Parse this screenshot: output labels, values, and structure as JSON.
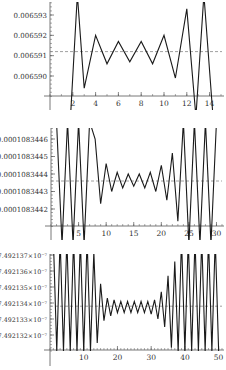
{
  "chart_data": [
    {
      "type": "line",
      "title": "",
      "xlabel": "",
      "ylabel": "",
      "x_ticks": [
        2,
        4,
        6,
        8,
        10,
        12,
        14
      ],
      "y_ticks": [
        0.00659,
        0.006591,
        0.006592,
        0.006593
      ],
      "y_tick_labels": [
        "0.006590",
        "0.006591",
        "0.006592",
        "0.006593"
      ],
      "xlim": [
        0,
        15
      ],
      "ylim": [
        0.0065886,
        0.0065937
      ],
      "reference_line": {
        "y": 0.0065912,
        "style": "dashed"
      },
      "series": [
        {
          "name": "iterates",
          "x": [
            1.8,
            2.4,
            3,
            4,
            5,
            6,
            7,
            8,
            9,
            10,
            11,
            12,
            12.8,
            13.5,
            14.3
          ],
          "y": [
            0.006588,
            0.006594,
            0.0065894,
            0.006592,
            0.0065906,
            0.0065917,
            0.0065907,
            0.0065917,
            0.0065906,
            0.006592,
            0.0065899,
            0.0065933,
            0.006588,
            0.006594,
            0.006588
          ]
        }
      ],
      "grid": false
    },
    {
      "type": "line",
      "title": "",
      "xlabel": "",
      "ylabel": "",
      "x_ticks": [
        5,
        10,
        15,
        20,
        25,
        30
      ],
      "y_ticks": [
        0.0001083442,
        0.0001083443,
        0.0001083444,
        0.0001083445,
        0.0001083446
      ],
      "y_tick_labels": [
        "0.0001083442",
        "0.0001083443",
        "0.0001083444",
        "0.0001083445",
        "0.0001083446"
      ],
      "xlim": [
        0,
        31
      ],
      "ylim": [
        0.0001083441,
        0.00010834464
      ],
      "reference_line": {
        "y": 0.00010834436,
        "style": "dashed"
      },
      "series": [
        {
          "name": "iterates",
          "x": [
            1,
            2,
            3,
            4,
            5,
            6,
            7,
            8,
            9,
            10,
            11,
            12,
            13,
            14,
            15,
            16,
            17,
            18,
            19,
            20,
            21,
            22,
            23,
            24,
            25,
            26,
            27,
            28,
            29,
            30
          ],
          "y": [
            0.0001083447,
            0.000108344,
            0.0001083447,
            0.000108344,
            0.0001083447,
            0.000108344,
            0.0001083447,
            0.0001083446,
            0.00010834423,
            0.00010834446,
            0.0001083443,
            0.00010834441,
            0.00010834432,
            0.0001083444,
            0.00010834433,
            0.0001083444,
            0.00010834432,
            0.00010834441,
            0.0001083443,
            0.00010834445,
            0.00010834425,
            0.00010834452,
            0.00010834413,
            0.0001083447,
            0.000108344,
            0.0001083447,
            0.000108344,
            0.0001083447,
            0.000108344,
            0.0001083447
          ]
        }
      ],
      "grid": false
    },
    {
      "type": "line",
      "title": "",
      "xlabel": "",
      "ylabel": "",
      "x_ticks": [
        10,
        20,
        30,
        40,
        50
      ],
      "y_ticks": [
        7.492132e-07,
        7.492133e-07,
        7.492134e-07,
        7.492135e-07,
        7.492136e-07,
        7.492137e-07
      ],
      "y_tick_labels": [
        "7.492132×10⁻⁷",
        "7.492133×10⁻⁷",
        "7.492134×10⁻⁷",
        "7.492135×10⁻⁷",
        "7.492136×10⁻⁷",
        "7.492137×10⁻⁷"
      ],
      "xlim": [
        0,
        51
      ],
      "ylim": [
        7.492131e-07,
        7.4921372e-07
      ],
      "reference_line": {
        "y": 7.4921338e-07,
        "style": "dashed"
      },
      "series": [
        {
          "name": "iterates",
          "x": [
            1,
            2,
            3,
            4,
            5,
            6,
            7,
            8,
            9,
            10,
            11,
            12,
            13,
            14,
            15,
            16,
            17,
            18,
            19,
            20,
            21,
            22,
            23,
            24,
            25,
            26,
            27,
            28,
            29,
            30,
            31,
            32,
            33,
            34,
            35,
            36,
            37,
            38,
            39,
            40,
            41,
            42,
            43,
            44,
            45,
            46,
            47,
            48,
            49,
            50
          ],
          "y": [
            7.492138e-07,
            7.492131e-07,
            7.492138e-07,
            7.492131e-07,
            7.492138e-07,
            7.492131e-07,
            7.492138e-07,
            7.492131e-07,
            7.492138e-07,
            7.492131e-07,
            7.492138e-07,
            7.492131e-07,
            7.4921372e-07,
            7.4921315e-07,
            7.4921352e-07,
            7.4921329e-07,
            7.4921343e-07,
            7.4921332e-07,
            7.4921342e-07,
            7.4921334e-07,
            7.4921341e-07,
            7.4921334e-07,
            7.4921341e-07,
            7.4921334e-07,
            7.4921341e-07,
            7.4921334e-07,
            7.4921341e-07,
            7.4921334e-07,
            7.4921341e-07,
            7.4921333e-07,
            7.4921342e-07,
            7.492133e-07,
            7.4921347e-07,
            7.4921325e-07,
            7.4921357e-07,
            7.4921312e-07,
            7.4921366e-07,
            7.492131e-07,
            7.492138e-07,
            7.492131e-07,
            7.492138e-07,
            7.492131e-07,
            7.492138e-07,
            7.492131e-07,
            7.492138e-07,
            7.492131e-07,
            7.492138e-07,
            7.492131e-07,
            7.492138e-07,
            7.492131e-07
          ]
        }
      ],
      "grid": false
    }
  ],
  "layout": {
    "panels": [
      {
        "top": 0,
        "plot_top": 2,
        "axis_y": 96,
        "bottom": 110,
        "y_axis_x": 50,
        "x_left_px": 50,
        "x_right_px": 221,
        "y_px": [
          76,
          56,
          35,
          15
        ]
      },
      {
        "top": 125,
        "plot_top": 128,
        "axis_y": 226,
        "bottom": 240,
        "y_axis_x": 51,
        "x_left_px": 51,
        "x_right_px": 222,
        "y_px": [
          209,
          191,
          174,
          157,
          139
        ]
      },
      {
        "top": 250,
        "plot_top": 254,
        "axis_y": 350,
        "bottom": 366,
        "y_axis_x": 50,
        "x_left_px": 50,
        "x_right_px": 222,
        "y_px": [
          335,
          319,
          303,
          287,
          271,
          255
        ]
      }
    ],
    "line_color": "#1a1a1a",
    "axis_color": "#555555",
    "ref_color": "#888888"
  }
}
